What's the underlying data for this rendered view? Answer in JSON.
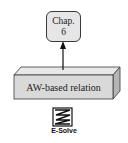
{
  "diagram": {
    "chapter_node": {
      "line1": "Chap.",
      "line2": "6"
    },
    "relation_box": {
      "label": "AW-based relation"
    },
    "tool_icon": {
      "icon": "e-solve-icon",
      "label": "E-Solve"
    },
    "colors": {
      "box_fill": "#d9d9d9",
      "box_top": "#e8e8e8",
      "box_side": "#b5b5b5",
      "node_fill": "#e6e6e6",
      "stroke": "#3a3a3a"
    }
  }
}
